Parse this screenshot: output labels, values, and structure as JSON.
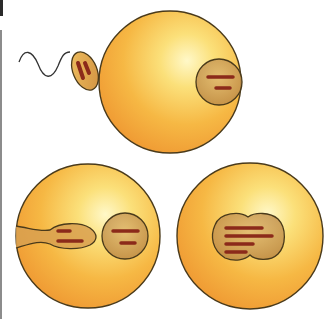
{
  "diagram": {
    "panels": [
      {
        "id": "sperm-contact",
        "label": ""
      },
      {
        "id": "sperm-entry",
        "label": ""
      },
      {
        "id": "pronuclei-fusion",
        "label": ""
      }
    ],
    "colors": {
      "egg_light": "#fdf3a8",
      "egg_mid": "#f7c44a",
      "egg_dark": "#ee9a2a",
      "outline": "#4a3a1a",
      "nucleus_fill": "#c99a52",
      "chromosome": "#8b2a1a",
      "chromosome_light": "#c9555a",
      "tail": "#333333"
    }
  }
}
